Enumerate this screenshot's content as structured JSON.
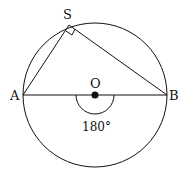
{
  "labels": {
    "S": "S",
    "A": "A",
    "B": "B",
    "O": "O",
    "angle": "180°"
  },
  "colors": {
    "stroke": "#111111",
    "background": "#ffffff"
  }
}
